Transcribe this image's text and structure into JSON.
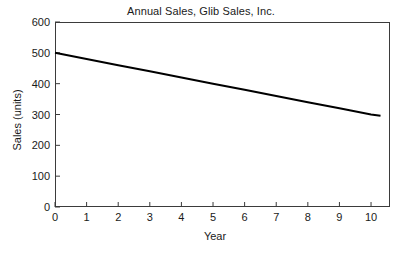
{
  "chart_data": {
    "type": "line",
    "title": "Annual Sales, Glib Sales, Inc.",
    "xlabel": "Year",
    "ylabel": "Sales (units)",
    "xlim": [
      0,
      10.6
    ],
    "ylim": [
      0,
      600
    ],
    "grid": false,
    "legend": null,
    "xticks": [
      0,
      1,
      2,
      3,
      4,
      5,
      6,
      7,
      8,
      9,
      10
    ],
    "xtick_labels": [
      "0",
      "1",
      "2",
      "3",
      "4",
      "5",
      "6",
      "7",
      "8",
      "9",
      "10"
    ],
    "yticks": [
      0,
      100,
      200,
      300,
      400,
      500,
      600
    ],
    "ytick_labels": [
      "0",
      "100",
      "200",
      "300",
      "400",
      "500",
      "600"
    ],
    "series": [
      {
        "name": "Annual Sales",
        "color": "#000000",
        "line_width": 2,
        "x": [
          0,
          1,
          2,
          3,
          4,
          5,
          6,
          7,
          8,
          9,
          10,
          10.3
        ],
        "values": [
          500,
          480,
          460,
          440,
          420,
          400,
          380,
          360,
          340,
          320,
          300,
          296
        ]
      }
    ]
  },
  "colors": {
    "background": "#ffffff",
    "axis": "#3b3b3b",
    "text": "#1a1a1a",
    "series": "#000000"
  }
}
